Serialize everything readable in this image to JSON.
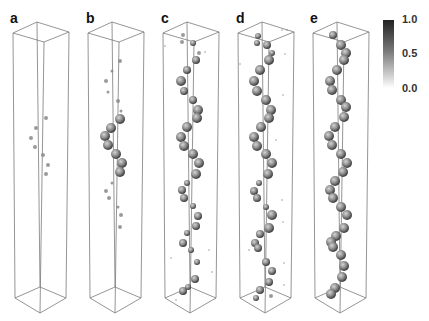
{
  "figure": {
    "colors": {
      "box_edge": "#7a7a7a",
      "axis_line": "#555555",
      "sphere_dark": "#3a3a3a",
      "sphere_mid": "#8a8a8a",
      "sphere_light": "#c8c8c8"
    },
    "box_geometry": {
      "dx": 75,
      "top": {
        "back": [
          37,
          22
        ],
        "left": [
          13,
          33
        ],
        "right": [
          69,
          32
        ],
        "front": [
          44,
          42
        ]
      },
      "bottom": {
        "back": [
          40,
          287
        ],
        "left": [
          15,
          298
        ],
        "right": [
          66,
          298
        ],
        "front": [
          40,
          313
        ]
      }
    },
    "panels": [
      {
        "label": "a",
        "label_pos": [
          10,
          11
        ],
        "spheres": [
          [
            46,
            118,
            2
          ],
          [
            36,
            128,
            2
          ],
          [
            31,
            138,
            2
          ],
          [
            35,
            147,
            2
          ],
          [
            43,
            155,
            2
          ],
          [
            48,
            165,
            2
          ],
          [
            46,
            174,
            2
          ]
        ]
      },
      {
        "label": "b",
        "label_pos": [
          86,
          11
        ],
        "spheres": [
          [
            120,
            61,
            2
          ],
          [
            112,
            71,
            1.5
          ],
          [
            106,
            81,
            2
          ],
          [
            108,
            92,
            1.5
          ],
          [
            118,
            101,
            2
          ],
          [
            121,
            111,
            1.5
          ],
          [
            120,
            119,
            5
          ],
          [
            111,
            128,
            5
          ],
          [
            105,
            136,
            5
          ],
          [
            108,
            145,
            5
          ],
          [
            116,
            154,
            5
          ],
          [
            122,
            163,
            5
          ],
          [
            120,
            172,
            5
          ],
          [
            112,
            183,
            1.5
          ],
          [
            106,
            191,
            2
          ],
          [
            109,
            198,
            2
          ],
          [
            118,
            207,
            1.5
          ],
          [
            121,
            215,
            2
          ],
          [
            120,
            227,
            2
          ]
        ]
      },
      {
        "label": "c",
        "label_pos": [
          161,
          11
        ],
        "spheres": [
          [
            183,
            35,
            2
          ],
          [
            182,
            42,
            2
          ],
          [
            193,
            43,
            3
          ],
          [
            199,
            53,
            2
          ],
          [
            196,
            60,
            4
          ],
          [
            187,
            70,
            4
          ],
          [
            181,
            81,
            5
          ],
          [
            184,
            91,
            4
          ],
          [
            193,
            100,
            4
          ],
          [
            198,
            110,
            5
          ],
          [
            197,
            118,
            5
          ],
          [
            187,
            127,
            5
          ],
          [
            181,
            137,
            5
          ],
          [
            184,
            146,
            5
          ],
          [
            193,
            154,
            5
          ],
          [
            199,
            163,
            5
          ],
          [
            196,
            174,
            5
          ],
          [
            187,
            183,
            3
          ],
          [
            182,
            190,
            4
          ],
          [
            184,
            198,
            4
          ],
          [
            193,
            206,
            3
          ],
          [
            198,
            216,
            4
          ],
          [
            196,
            226,
            4
          ],
          [
            187,
            233,
            3
          ],
          [
            183,
            243,
            4
          ],
          [
            191,
            250,
            3
          ],
          [
            197,
            262,
            3
          ],
          [
            195,
            279,
            4
          ],
          [
            188,
            287,
            3
          ],
          [
            183,
            291,
            4
          ],
          [
            209,
            250,
            1
          ],
          [
            212,
            272,
            1
          ],
          [
            171,
            258,
            1
          ],
          [
            176,
            300,
            1
          ],
          [
            205,
            52,
            1
          ],
          [
            165,
            46,
            1
          ]
        ]
      },
      {
        "label": "d",
        "label_pos": [
          236,
          11
        ],
        "spheres": [
          [
            258,
            36,
            3
          ],
          [
            257,
            43,
            3
          ],
          [
            267,
            45,
            4
          ],
          [
            272,
            53,
            3
          ],
          [
            269,
            60,
            5
          ],
          [
            260,
            70,
            5
          ],
          [
            254,
            81,
            5
          ],
          [
            257,
            91,
            5
          ],
          [
            266,
            100,
            5
          ],
          [
            271,
            110,
            5
          ],
          [
            269,
            118,
            5
          ],
          [
            261,
            127,
            5
          ],
          [
            254,
            137,
            5
          ],
          [
            257,
            146,
            5
          ],
          [
            266,
            154,
            5
          ],
          [
            272,
            163,
            5
          ],
          [
            268,
            174,
            5
          ],
          [
            259,
            183,
            3
          ],
          [
            254,
            191,
            4
          ],
          [
            257,
            198,
            4
          ],
          [
            266,
            207,
            3
          ],
          [
            272,
            215,
            5
          ],
          [
            269,
            228,
            5
          ],
          [
            260,
            234,
            4
          ],
          [
            255,
            243,
            4
          ],
          [
            258,
            248,
            4
          ],
          [
            266,
            262,
            4
          ],
          [
            272,
            271,
            4
          ],
          [
            269,
            282,
            4
          ],
          [
            260,
            290,
            4
          ],
          [
            256,
            298,
            3
          ],
          [
            282,
            30,
            1
          ],
          [
            287,
            30,
            1
          ],
          [
            285,
            54,
            1
          ],
          [
            240,
            64,
            1
          ],
          [
            283,
            95,
            1
          ],
          [
            282,
            200,
            1
          ],
          [
            283,
            222,
            1
          ],
          [
            249,
            250,
            1
          ],
          [
            284,
            263,
            1
          ],
          [
            284,
            285,
            1
          ],
          [
            271,
            296,
            2
          ],
          [
            276,
            140,
            1
          ]
        ]
      },
      {
        "label": "e",
        "label_pos": [
          310,
          11
        ],
        "spheres": [
          [
            333,
            35,
            4
          ],
          [
            341,
            45,
            5
          ],
          [
            346,
            53,
            5
          ],
          [
            344,
            60,
            5
          ],
          [
            337,
            70,
            5
          ],
          [
            330,
            81,
            5
          ],
          [
            332,
            90,
            5
          ],
          [
            341,
            100,
            5
          ],
          [
            346,
            107,
            5
          ],
          [
            344,
            117,
            5
          ],
          [
            335,
            127,
            5
          ],
          [
            329,
            136,
            5
          ],
          [
            332,
            145,
            5
          ],
          [
            341,
            154,
            5
          ],
          [
            347,
            163,
            5
          ],
          [
            343,
            172,
            5
          ],
          [
            335,
            181,
            5
          ],
          [
            330,
            190,
            5
          ],
          [
            333,
            198,
            5
          ],
          [
            341,
            207,
            5
          ],
          [
            347,
            215,
            5
          ],
          [
            344,
            228,
            5
          ],
          [
            336,
            236,
            5
          ],
          [
            331,
            242,
            5
          ],
          [
            333,
            247,
            5
          ],
          [
            341,
            255,
            5
          ],
          [
            344,
            266,
            5
          ],
          [
            342,
            277,
            5
          ],
          [
            335,
            288,
            5
          ],
          [
            331,
            294,
            5
          ]
        ]
      }
    ],
    "colorbar": {
      "ticks": [
        {
          "label": "1.0",
          "pos": [
            402,
            14
          ]
        },
        {
          "label": "0.5",
          "pos": [
            402,
            48
          ]
        },
        {
          "label": "0.0",
          "pos": [
            402,
            83
          ]
        }
      ],
      "range": [
        0.0,
        1.0
      ]
    }
  }
}
